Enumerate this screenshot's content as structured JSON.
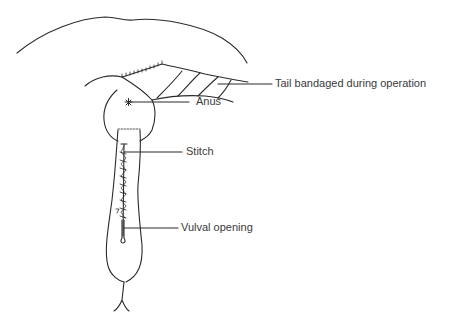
{
  "diagram": {
    "type": "anatomical-line-drawing",
    "line_color": "#2a2a2a",
    "text_color": "#3a3a3a",
    "labels": [
      {
        "id": "tail",
        "text": "Tail bandaged during operation",
        "x": 275,
        "y": 78
      },
      {
        "id": "anus",
        "text": "Anus",
        "x": 196,
        "y": 101
      },
      {
        "id": "stitch",
        "text": "Stitch",
        "x": 186,
        "y": 146
      },
      {
        "id": "vulval_opening",
        "text": "Vulval opening",
        "x": 181,
        "y": 222
      }
    ]
  }
}
